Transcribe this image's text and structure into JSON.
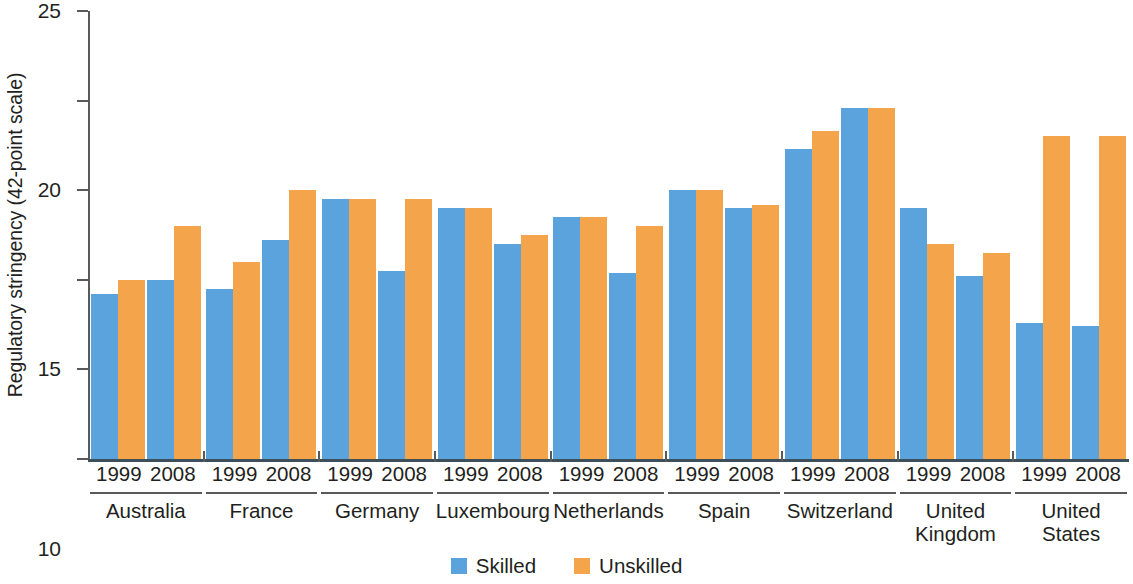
{
  "chart_data": {
    "type": "bar",
    "title": "",
    "xlabel": "",
    "ylabel": "Regulatory stringency (42-point scale)",
    "ylim": [
      0,
      25
    ],
    "yticks": [
      0,
      5,
      10,
      15,
      20,
      25
    ],
    "grid": false,
    "legend_position": "bottom-center",
    "categories": [
      "Australia",
      "France",
      "Germany",
      "Luxembourg",
      "Netherlands",
      "Spain",
      "Switzerland",
      "United Kingdom",
      "United States"
    ],
    "subcategories": [
      "1999",
      "2008"
    ],
    "series": [
      {
        "name": "Skilled",
        "color": "#5ba3dc",
        "values_1999": [
          9.2,
          9.5,
          14.5,
          14.0,
          13.5,
          15.0,
          17.3,
          14.0,
          7.6
        ],
        "values_2008": [
          10.0,
          12.2,
          10.5,
          12.0,
          10.4,
          14.0,
          19.6,
          10.2,
          7.4
        ]
      },
      {
        "name": "Unskilled",
        "color": "#f4a44b",
        "values_1999": [
          10.0,
          11.0,
          14.5,
          14.0,
          13.5,
          15.0,
          18.3,
          12.0,
          18.0
        ],
        "values_2008": [
          13.0,
          15.0,
          14.5,
          12.5,
          13.0,
          14.2,
          19.6,
          11.5,
          18.0
        ]
      }
    ]
  },
  "axis": {
    "y_title": "Regulatory stringency (42-point scale)",
    "y_tick_labels": [
      "25",
      "20",
      "15",
      "10",
      "5",
      "0"
    ]
  },
  "legend": {
    "items": [
      {
        "label": "Skilled",
        "color": "#5ba3dc",
        "swatch_name": "skilled-swatch"
      },
      {
        "label": "Unskilled",
        "color": "#f4a44b",
        "swatch_name": "unskilled-swatch"
      }
    ]
  },
  "groups": [
    {
      "country": "Australia",
      "year_1999": "1999",
      "year_2008": "2008"
    },
    {
      "country": "France",
      "year_1999": "1999",
      "year_2008": "2008"
    },
    {
      "country": "Germany",
      "year_1999": "1999",
      "year_2008": "2008"
    },
    {
      "country": "Luxembourg",
      "year_1999": "1999",
      "year_2008": "2008"
    },
    {
      "country": "Netherlands",
      "year_1999": "1999",
      "year_2008": "2008"
    },
    {
      "country": "Spain",
      "year_1999": "1999",
      "year_2008": "2008"
    },
    {
      "country": "Switzerland",
      "year_1999": "1999",
      "year_2008": "2008"
    },
    {
      "country": "United\nKingdom",
      "year_1999": "1999",
      "year_2008": "2008"
    },
    {
      "country": "United\nStates",
      "year_1999": "1999",
      "year_2008": "2008"
    }
  ]
}
